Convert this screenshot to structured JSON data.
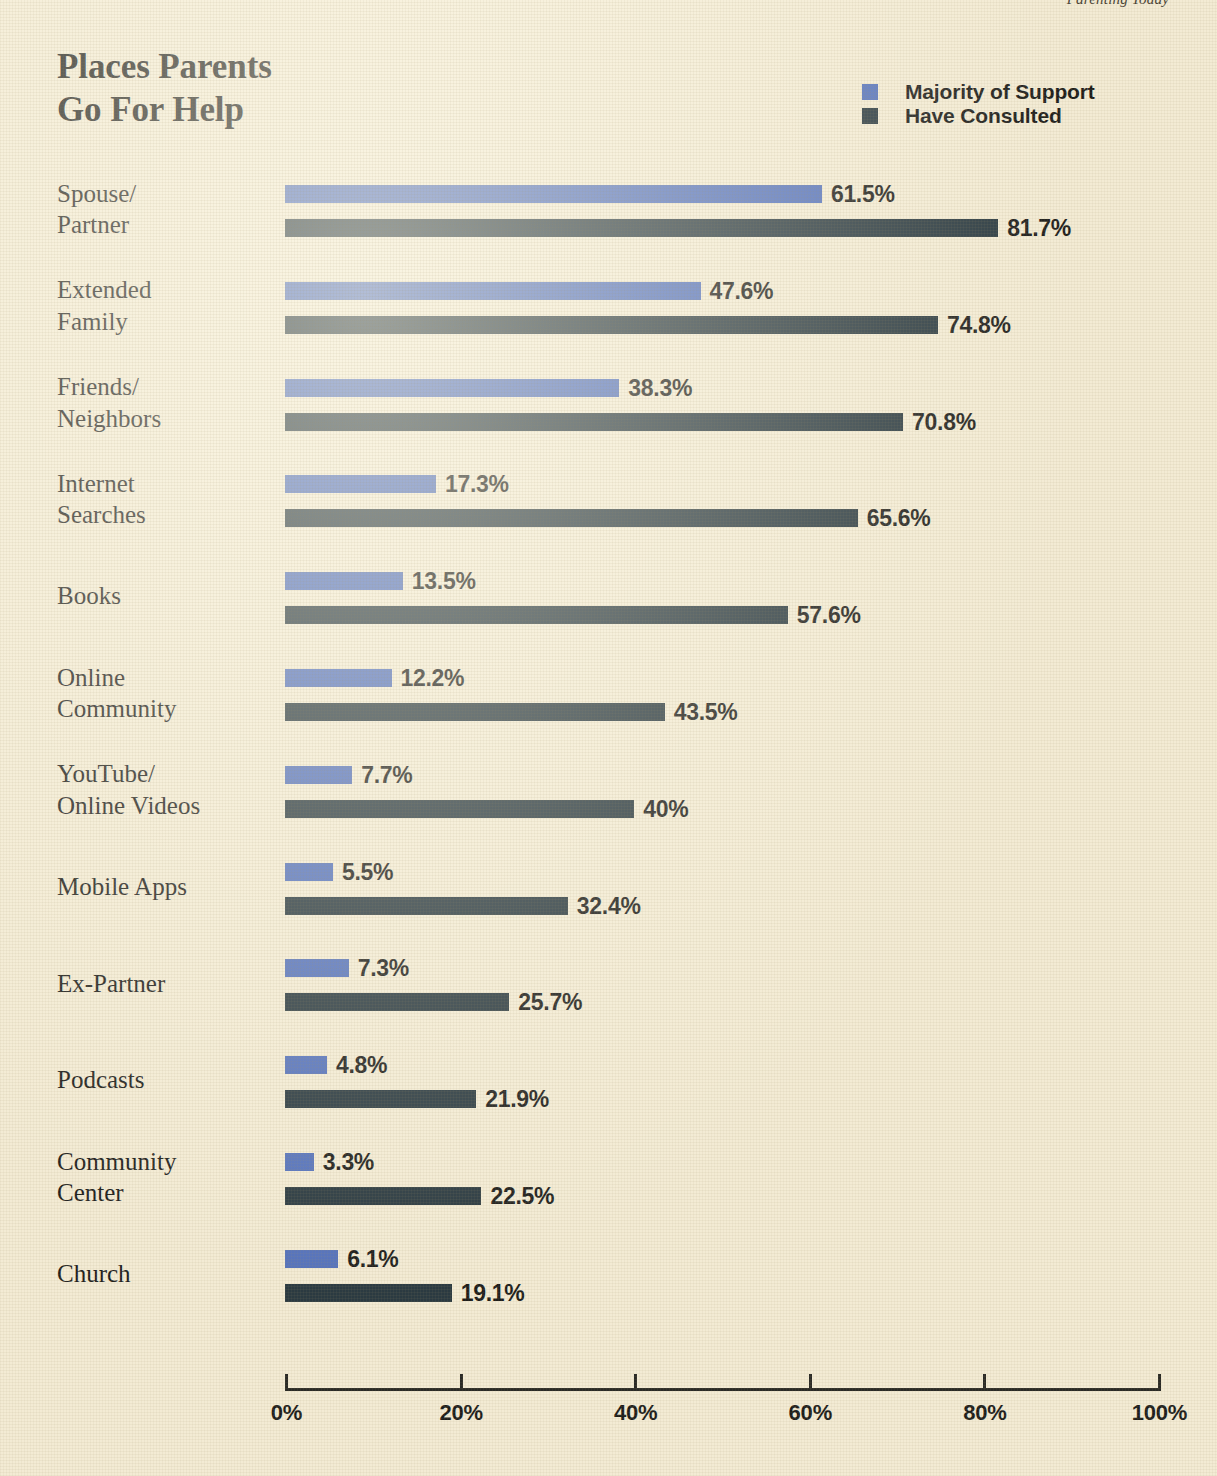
{
  "running_head": "Parenting Today",
  "header": {
    "title": "Places Parents\nGo For Help"
  },
  "legend": {
    "items": [
      {
        "label": "Majority of Support",
        "color": "#5572bb",
        "swatch_name": "legend-swatch-majority-of-support"
      },
      {
        "label": "Have Consulted",
        "color": "#2b3a41",
        "swatch_name": "legend-swatch-have-consulted"
      }
    ]
  },
  "axis": {
    "ticks": [
      "0%",
      "20%",
      "40%",
      "60%",
      "80%",
      "100%"
    ],
    "min": 0,
    "max": 100
  },
  "colors": {
    "background": "#f3ebd4",
    "majority_of_support": "#5572bb",
    "have_consulted": "#2b3a41",
    "text": "#20201c",
    "axis": "#2a2a26"
  },
  "chart_data": {
    "type": "bar",
    "orientation": "horizontal",
    "title": "Places Parents Go For Help",
    "xlabel": "",
    "ylabel": "",
    "xlim": [
      0,
      100
    ],
    "grid": false,
    "legend_position": "top-right",
    "value_suffix": "%",
    "categories": [
      "Spouse/\nPartner",
      "Extended\nFamily",
      "Friends/\nNeighbors",
      "Internet\nSearches",
      "Books",
      "Online\nCommunity",
      "YouTube/\nOnline Videos",
      "Mobile Apps",
      "Ex-Partner",
      "Podcasts",
      "Community\nCenter",
      "Church"
    ],
    "series": [
      {
        "name": "Majority of Support",
        "color": "#5572bb",
        "values": [
          61.5,
          47.6,
          38.3,
          17.3,
          13.5,
          12.2,
          7.7,
          5.5,
          7.3,
          4.8,
          3.3,
          6.1
        ],
        "labels": [
          "61.5%",
          "47.6%",
          "38.3%",
          "17.3%",
          "13.5%",
          "12.2%",
          "7.7%",
          "5.5%",
          "7.3%",
          "4.8%",
          "3.3%",
          "6.1%"
        ]
      },
      {
        "name": "Have Consulted",
        "color": "#2b3a41",
        "values": [
          81.7,
          74.8,
          70.8,
          65.6,
          57.6,
          43.5,
          40,
          32.4,
          25.7,
          21.9,
          22.5,
          19.1
        ],
        "labels": [
          "81.7%",
          "74.8%",
          "70.8%",
          "65.6%",
          "57.6%",
          "43.5%",
          "40%",
          "32.4%",
          "25.7%",
          "21.9%",
          "22.5%",
          "19.1%"
        ]
      }
    ]
  }
}
